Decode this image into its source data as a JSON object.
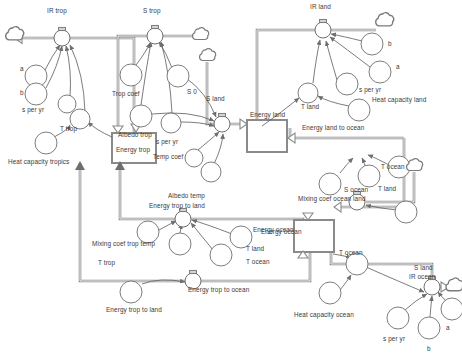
{
  "diagram": {
    "type": "system-dynamics-stock-flow",
    "width": 462,
    "height": 359,
    "background_color": "#ffffff",
    "pipe_color": "#8a8a8a",
    "connector_color": "#5a5a5a",
    "text_color": "#3a3a3a"
  },
  "stocks": [
    {
      "id": "energy_trop",
      "label": "Energy trop",
      "x": 112,
      "y": 133,
      "w": 44,
      "h": 30,
      "label_x": 136,
      "label_y": 149
    },
    {
      "id": "energy_land",
      "label": "Energy land",
      "x": 247,
      "y": 120,
      "w": 40,
      "h": 32,
      "label_x": 248,
      "label_y": 118
    },
    {
      "id": "energy_ocean",
      "label": "Energy ocean",
      "x": 294,
      "y": 220,
      "w": 40,
      "h": 32,
      "label_x": 263,
      "label_y": 232
    }
  ],
  "flows": [
    {
      "id": "ir_trop",
      "label": "IR trop",
      "x": 62,
      "y": 36,
      "label_x": 47,
      "label_y": 14
    },
    {
      "id": "s_trop",
      "label": "S trop",
      "x": 155,
      "y": 33,
      "label_x": 143,
      "label_y": 17
    },
    {
      "id": "s_land",
      "label": "S land",
      "x": 222,
      "y": 124,
      "label_x": 208,
      "label_y": 103
    },
    {
      "id": "ir_land",
      "label": "IR land",
      "x": 323,
      "y": 30,
      "label_x": 310,
      "label_y": 11
    },
    {
      "id": "s_ocean",
      "label": "S ocean",
      "x": 357,
      "y": 202,
      "label_x": 343,
      "label_y": 192
    },
    {
      "id": "ir_ocean",
      "label": "IR ocean",
      "x": 432,
      "y": 287,
      "label_x": 410,
      "label_y": 278
    },
    {
      "id": "energy_trop_to_land_flow",
      "label": "Energy trop to land",
      "x": 183,
      "y": 218,
      "label_x": 148,
      "label_y": 208
    },
    {
      "id": "energy_trop_to_ocean_flow",
      "label": "Energy trop to ocean",
      "x": 193,
      "y": 280,
      "label_x": 186,
      "label_y": 288
    },
    {
      "id": "energy_land_to_ocean_flow",
      "label": "Energy land to ocean",
      "x": 0,
      "y": 0,
      "label_x": 303,
      "label_y": 128
    },
    {
      "id": "mixing_coef_ocean_land_flow",
      "label": "Mixing coef ocean land",
      "x": 0,
      "y": 0,
      "label_x": 299,
      "label_y": 200
    }
  ],
  "variables": [
    {
      "id": "v_a_trop",
      "label": "a",
      "cx": 36,
      "cy": 76,
      "r": 11,
      "label_x": 20,
      "label_y": 70
    },
    {
      "id": "v_b_trop",
      "label": "b",
      "cx": 36,
      "cy": 94,
      "r": 11,
      "label_x": 20,
      "label_y": 94
    },
    {
      "id": "v_speryr_trop",
      "label": "s per yr",
      "cx": 64,
      "cy": 103,
      "r": 9,
      "label_x": 22,
      "label_y": 110
    },
    {
      "id": "v_t_trop_1",
      "label": "T trop",
      "cx": 78,
      "cy": 119,
      "r": 10,
      "label_x": 62,
      "label_y": 129
    },
    {
      "id": "v_heat_cap_trop",
      "label": "Heat capacity tropics",
      "cx": 46,
      "cy": 143,
      "r": 11,
      "label_x": 8,
      "label_y": 163
    },
    {
      "id": "v_trop_coef",
      "label": "Trop coef",
      "cx": 131,
      "cy": 75,
      "r": 11,
      "label_x": 112,
      "label_y": 95
    },
    {
      "id": "v_s0",
      "label": "S 0",
      "cx": 178,
      "cy": 76,
      "r": 11,
      "label_x": 186,
      "label_y": 93
    },
    {
      "id": "v_albedo_trop",
      "label": "Albedo trop",
      "cx": 141,
      "cy": 116,
      "r": 11,
      "label_x": 120,
      "label_y": 136
    },
    {
      "id": "v_speryr_trop2",
      "label": "s per yr",
      "cx": 170,
      "cy": 124,
      "r": 11,
      "label_x": 156,
      "label_y": 143
    },
    {
      "id": "v_temp_coef",
      "label": "Temp coef",
      "cx": 200,
      "cy": 160,
      "r": 10,
      "label_x": 154,
      "label_y": 157
    },
    {
      "id": "v_albedo_temp",
      "label": "Albedo temp",
      "cx": 217,
      "cy": 174,
      "r": 10,
      "label_x": 168,
      "label_y": 197
    },
    {
      "id": "v_mixing_trop_temp",
      "label": "Mixing coef trop temp",
      "cx": 148,
      "cy": 232,
      "r": 11,
      "label_x": 94,
      "label_y": 245
    },
    {
      "id": "v_t_trop_2",
      "label": "T trop",
      "cx": 182,
      "cy": 244,
      "r": 11,
      "label_x": 98,
      "label_y": 264
    },
    {
      "id": "v_energy_ocean_var",
      "label": "Energy ocean",
      "cx": 242,
      "cy": 238,
      "r": 11,
      "label_x": 252,
      "label_y": 231
    },
    {
      "id": "v_t_land_c",
      "label": "T land",
      "cx": 222,
      "cy": 255,
      "r": 11,
      "label_x": 246,
      "label_y": 250
    },
    {
      "id": "v_t_ocean_c",
      "label": "T ocean",
      "cx": 0,
      "cy": 0,
      "r": 0,
      "label_x": 246,
      "label_y": 263
    },
    {
      "id": "v_energy_trop_to_land_src",
      "label": "Energy trop to land",
      "cx": 131,
      "cy": 292,
      "r": 11,
      "label_x": 106,
      "label_y": 311
    },
    {
      "id": "v_b_land",
      "label": "b",
      "cx": 372,
      "cy": 44,
      "r": 11,
      "label_x": 389,
      "label_y": 44
    },
    {
      "id": "v_a_land",
      "label": "a",
      "cx": 380,
      "cy": 72,
      "r": 11,
      "label_x": 397,
      "label_y": 67
    },
    {
      "id": "v_speryr_land",
      "label": "s per yr",
      "cx": 347,
      "cy": 84,
      "r": 11,
      "label_x": 360,
      "label_y": 90
    },
    {
      "id": "v_t_land_1",
      "label": "T land",
      "cx": 308,
      "cy": 93,
      "r": 10,
      "label_x": 303,
      "label_y": 107
    },
    {
      "id": "v_heat_cap_land",
      "label": "Heat capacity land",
      "cx": 359,
      "cy": 110,
      "r": 11,
      "label_x": 374,
      "label_y": 100
    },
    {
      "id": "v_t_ocean_1",
      "label": "T ocean",
      "cx": 398,
      "cy": 170,
      "r": 11,
      "label_x": 382,
      "label_y": 170
    },
    {
      "id": "v_t_land_2",
      "label": "T land",
      "cx": 369,
      "cy": 178,
      "r": 11,
      "label_x": 379,
      "label_y": 190
    },
    {
      "id": "v_mixing_ocean_land",
      "label": "Mixing coef ocean land",
      "cx": 337,
      "cy": 184,
      "r": 11,
      "label_x": 299,
      "label_y": 200
    },
    {
      "id": "v_s_ocean_src",
      "label": "S ocean",
      "cx": 406,
      "cy": 213,
      "r": 11,
      "label_x": 343,
      "label_y": 192
    },
    {
      "id": "v_t_ocean_2",
      "label": "T ocean",
      "cx": 355,
      "cy": 265,
      "r": 11,
      "label_x": 340,
      "label_y": 254
    },
    {
      "id": "v_heat_cap_ocean",
      "label": "Heat capacity ocean",
      "cx": 330,
      "cy": 293,
      "r": 11,
      "label_x": 296,
      "label_y": 316
    },
    {
      "id": "v_speryr_ocean",
      "label": "s per yr",
      "cx": 400,
      "cy": 319,
      "r": 11,
      "label_x": 384,
      "label_y": 339
    },
    {
      "id": "v_b_ocean",
      "label": "b",
      "cx": 430,
      "cy": 328,
      "r": 11,
      "label_x": 428,
      "label_y": 350
    },
    {
      "id": "v_a_ocean",
      "label": "a",
      "cx": 452,
      "cy": 310,
      "r": 11,
      "label_x": 447,
      "label_y": 328
    }
  ],
  "clouds": [
    {
      "id": "cloud_ir_trop_sink",
      "cx": 14,
      "cy": 36
    },
    {
      "id": "cloud_s_trop_src",
      "cx": 200,
      "cy": 36
    },
    {
      "id": "cloud_s_land_src",
      "cx": 207,
      "cy": 57
    },
    {
      "id": "cloud_ir_land_sink",
      "cx": 382,
      "cy": 22
    },
    {
      "id": "cloud_s_ocean_src",
      "cx": 414,
      "cy": 167
    },
    {
      "id": "cloud_ir_ocean_sink",
      "cx": 452,
      "cy": 287
    }
  ],
  "free_labels": [
    {
      "id": "lbl_s_land_top",
      "text": "S land",
      "x": 208,
      "y": 103
    },
    {
      "id": "lbl_energy_land_to_ocean",
      "text": "Energy land to ocean",
      "x": 303,
      "y": 128
    },
    {
      "id": "lbl_s_land_ocean",
      "text": "S land",
      "x": 416,
      "y": 269
    }
  ]
}
